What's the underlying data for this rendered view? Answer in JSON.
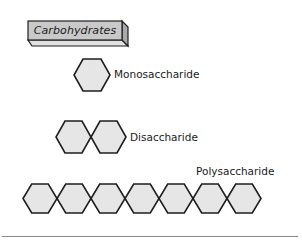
{
  "diagram": {
    "title": "Carbohydrates",
    "colors": {
      "hexagon_fill": "#e6e6e6",
      "hexagon_stroke": "#1e1e1e",
      "box_front": "#c9c9c9",
      "box_bottom": "#e2e2e2",
      "box_side": "#a9a9a9",
      "rule": "#8a8a8a"
    },
    "groups": [
      {
        "label": "Monosaccharide",
        "hexagon_count": 1
      },
      {
        "label": "Disaccharide",
        "hexagon_count": 2
      },
      {
        "label": "Polysaccharide",
        "hexagon_count": 7
      }
    ]
  }
}
